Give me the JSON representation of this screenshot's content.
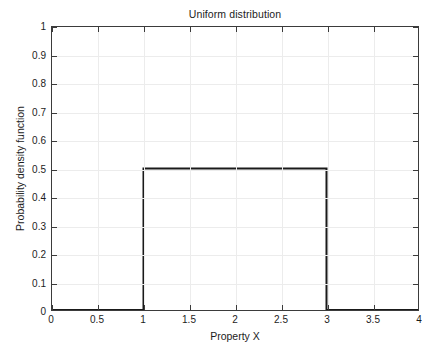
{
  "chart_data": {
    "type": "line",
    "title": "Uniform distribution",
    "xlabel": "Property X",
    "ylabel": "Probability density function",
    "xlim": [
      0,
      4
    ],
    "ylim": [
      0,
      1
    ],
    "grid": true,
    "legend": null,
    "xticks": [
      0,
      0.5,
      1,
      1.5,
      2,
      2.5,
      3,
      3.5,
      4
    ],
    "xtick_labels": [
      "0",
      "0.5",
      "1",
      "1.5",
      "2",
      "2.5",
      "3",
      "3.5",
      "4"
    ],
    "yticks": [
      0,
      0.1,
      0.2,
      0.3,
      0.4,
      0.5,
      0.6,
      0.7,
      0.8,
      0.9,
      1
    ],
    "ytick_labels": [
      "0",
      "0.1",
      "0.2",
      "0.3",
      "0.4",
      "0.5",
      "0.6",
      "0.7",
      "0.8",
      "0.9",
      "1"
    ],
    "series": [
      {
        "name": "Uniform pdf",
        "color": "#1a1a1a",
        "line_width": 2,
        "x": [
          0,
          1,
          1,
          3,
          3,
          4
        ],
        "y": [
          0,
          0,
          0.5,
          0.5,
          0,
          0
        ]
      }
    ],
    "distribution": {
      "family": "uniform",
      "lower_bound": 1,
      "upper_bound": 3,
      "density_height": 0.5
    }
  },
  "style": {
    "axis_color": "#3b3b3b",
    "grid_color": "#ececec",
    "text_color": "#1c1c1c",
    "background": "#ffffff"
  }
}
